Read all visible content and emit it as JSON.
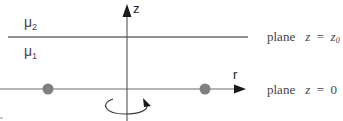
{
  "diagram": {
    "axes": {
      "vertical_label": "z",
      "horizontal_label": "r"
    },
    "regions": {
      "upper": {
        "symbol": "μ",
        "subscript": "2"
      },
      "lower": {
        "symbol": "μ",
        "subscript": "1"
      }
    },
    "planes": {
      "top": {
        "word": "plane",
        "lhs": "z",
        "eq": "=",
        "rhs": "z",
        "rhs_sub": "0"
      },
      "bottom": {
        "word": "plane",
        "lhs": "z",
        "eq": "=",
        "rhs": "0"
      }
    },
    "points": [
      {
        "name": "left-charge",
        "x": 48,
        "y": 89
      },
      {
        "name": "right-charge",
        "x": 205,
        "y": 89
      }
    ],
    "colors": {
      "line": "#6e6e6e",
      "axis": "#333333",
      "dot": "#808080",
      "text": "#444444"
    },
    "rotation_indicator": "azimuthal-rotation-about-z"
  }
}
